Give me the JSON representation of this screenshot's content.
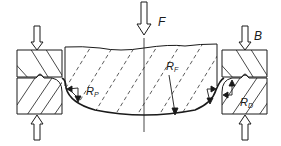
{
  "diagram": {
    "type": "forming-process-cross-section",
    "labels": {
      "force": "F",
      "blank_holder": "B",
      "punch_radius_main": "R",
      "punch_radius_sub": "P",
      "final_radius_main": "R",
      "final_radius_sub": "F",
      "die_radius_main": "R",
      "die_radius_sub": "D"
    },
    "colors": {
      "line": "#1a1a1a",
      "background": "#ffffff"
    }
  }
}
